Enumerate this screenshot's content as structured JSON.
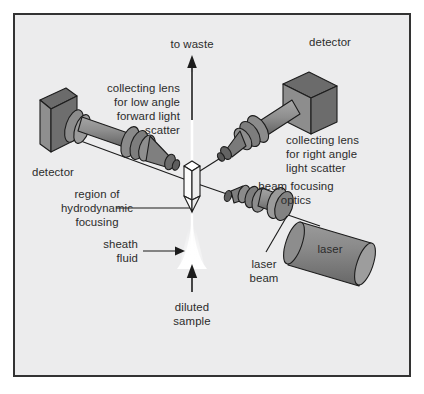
{
  "figure": {
    "frame": {
      "background_color": "#ececed",
      "border_color": "#333333",
      "page_color": "#ffffff"
    },
    "palette": {
      "optic_front": "#8c8c8c",
      "optic_top": "#6e6e6e",
      "optic_dark": "#5c5c5c",
      "optic_light": "#a3a3a3",
      "flow_cell": "#fbfbfb",
      "sheath": "#ffffff",
      "outline": "#1c1c1c",
      "text": "#2b2b2b"
    }
  },
  "labels": {
    "to_waste": "to waste",
    "detector_right": "detector",
    "detector_left": "detector",
    "collecting_lens_forward": [
      "collecting lens",
      "for low angle",
      "forward  light",
      "scatter"
    ],
    "collecting_lens_right_angle": [
      "collecting lens",
      "for right angle",
      "light scatter"
    ],
    "beam_focusing_optics": [
      "beam focusing",
      "optics"
    ],
    "region_hydrodynamic": [
      "region of",
      "hydrodynamic",
      "focusing"
    ],
    "sheath_fluid": [
      "sheath",
      "fluid"
    ],
    "diluted_sample": [
      "diluted",
      "sample"
    ],
    "laser_beam": [
      "laser",
      "beam"
    ],
    "laser": "laser"
  },
  "components": {
    "detector_left": "photodetector-box-left",
    "detector_right": "photodetector-box-right",
    "forward_lens": "forward-scatter-collecting-lens",
    "right_angle_lens": "right-angle-collecting-lens",
    "flow_cell": "flow-cell-chamber",
    "sheath_stream": "sheath-fluid-stream",
    "beam_optics": "beam-focusing-optics",
    "laser_source": "laser-tube",
    "waste_arrow": "to-waste-arrow",
    "sample_arrow": "diluted-sample-arrow"
  }
}
